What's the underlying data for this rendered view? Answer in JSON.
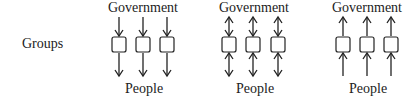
{
  "row_label": "Groups",
  "diagrams": [
    {
      "id": "top-down",
      "top_label": "Government",
      "bottom_label": "People",
      "upper_arrow": "down",
      "lower_arrow": "down",
      "group_count": 3
    },
    {
      "id": "two-way",
      "top_label": "Government",
      "bottom_label": "People",
      "upper_arrow": "both",
      "lower_arrow": "both",
      "group_count": 3
    },
    {
      "id": "bottom-up",
      "top_label": "Government",
      "bottom_label": "People",
      "upper_arrow": "up",
      "lower_arrow": "up",
      "group_count": 3
    }
  ],
  "colors": {
    "line": "#222222",
    "box_fill": "#ffffff",
    "background": "#ffffff"
  }
}
